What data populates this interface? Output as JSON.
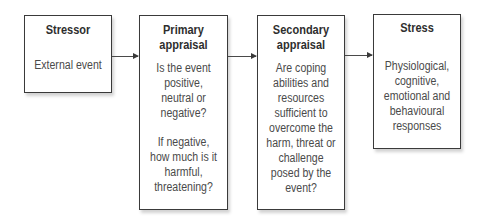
{
  "diagram": {
    "boxes": [
      {
        "id": "stressor",
        "title": "Stressor",
        "body": [
          "External event"
        ]
      },
      {
        "id": "primary",
        "title_lines": [
          "Primary",
          "appraisal"
        ],
        "body": [
          "Is the event",
          "positive,",
          "neutral or",
          "negative?",
          "",
          "If negative,",
          "how much is it",
          "harmful,",
          "threatening?"
        ]
      },
      {
        "id": "secondary",
        "title_lines": [
          "Secondary",
          "appraisal"
        ],
        "body": [
          "Are coping",
          "abilities and",
          "resources",
          "sufficient to",
          "overcome the",
          "harm, threat or",
          "challenge",
          "posed by the",
          "event?"
        ]
      },
      {
        "id": "stress",
        "title": "Stress",
        "body": [
          "Physiological,",
          "cognitive,",
          "emotional and",
          "behavioural",
          "responses"
        ]
      }
    ],
    "arrows": [
      {
        "from": "stressor",
        "to": "primary"
      },
      {
        "from": "primary",
        "to": "secondary"
      },
      {
        "from": "secondary",
        "to": "stress"
      }
    ]
  }
}
